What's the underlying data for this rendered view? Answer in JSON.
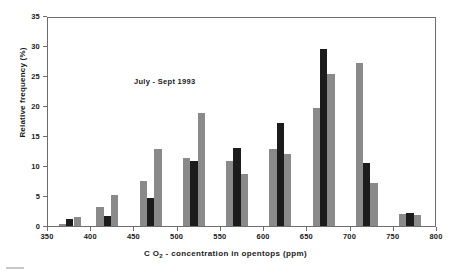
{
  "annotation": {
    "text": "July - Sept 1993"
  },
  "axes": {
    "y_title": "Relative frequency (%)",
    "x_title_pre": "C O",
    "x_title_sub": "2",
    "x_title_post": " - concentration in opentops (ppm)",
    "y_ticks": [
      "0",
      "5",
      "10",
      "15",
      "20",
      "25",
      "30",
      "35"
    ],
    "x_ticks": [
      "350",
      "400",
      "450",
      "500",
      "550",
      "600",
      "650",
      "700",
      "750",
      "800"
    ]
  },
  "chart_data": {
    "type": "bar",
    "title": "",
    "annotations": [
      "July - Sept 1993"
    ],
    "xlabel": "CO2 - concentration in opentops (ppm)",
    "ylabel": "Relative frequency (%)",
    "xlim": [
      350,
      800
    ],
    "ylim": [
      0,
      35
    ],
    "yticks": [
      0,
      5,
      10,
      15,
      20,
      25,
      30,
      35
    ],
    "xticks": [
      350,
      400,
      450,
      500,
      550,
      600,
      650,
      700,
      750,
      800
    ],
    "grid": false,
    "legend": "none",
    "colors": {
      "light": "#8a8a8a",
      "dark": "#1c1c1c"
    },
    "bin_width_ppm": 12.5,
    "bars": [
      {
        "x_left": 362.5,
        "x_right": 371.0,
        "value": 0.3,
        "color": "light"
      },
      {
        "x_left": 371.0,
        "x_right": 379.5,
        "value": 1.2,
        "color": "dark"
      },
      {
        "x_left": 379.5,
        "x_right": 388.0,
        "value": 1.5,
        "color": "light"
      },
      {
        "x_left": 406.0,
        "x_right": 414.5,
        "value": 3.2,
        "color": "light"
      },
      {
        "x_left": 414.5,
        "x_right": 423.0,
        "value": 1.6,
        "color": "dark"
      },
      {
        "x_left": 423.0,
        "x_right": 431.5,
        "value": 5.1,
        "color": "light"
      },
      {
        "x_left": 456.0,
        "x_right": 464.5,
        "value": 7.5,
        "color": "light"
      },
      {
        "x_left": 464.5,
        "x_right": 473.0,
        "value": 4.6,
        "color": "dark"
      },
      {
        "x_left": 473.0,
        "x_right": 481.5,
        "value": 12.9,
        "color": "light"
      },
      {
        "x_left": 506.0,
        "x_right": 514.5,
        "value": 11.4,
        "color": "light"
      },
      {
        "x_left": 514.5,
        "x_right": 523.0,
        "value": 10.9,
        "color": "dark"
      },
      {
        "x_left": 523.0,
        "x_right": 531.5,
        "value": 18.8,
        "color": "light"
      },
      {
        "x_left": 556.0,
        "x_right": 564.5,
        "value": 10.9,
        "color": "light"
      },
      {
        "x_left": 564.5,
        "x_right": 573.0,
        "value": 13.0,
        "color": "dark"
      },
      {
        "x_left": 573.0,
        "x_right": 581.5,
        "value": 8.7,
        "color": "light"
      },
      {
        "x_left": 606.0,
        "x_right": 614.5,
        "value": 12.8,
        "color": "light"
      },
      {
        "x_left": 614.5,
        "x_right": 623.0,
        "value": 17.1,
        "color": "dark"
      },
      {
        "x_left": 623.0,
        "x_right": 631.5,
        "value": 12.0,
        "color": "light"
      },
      {
        "x_left": 656.0,
        "x_right": 664.5,
        "value": 19.7,
        "color": "light"
      },
      {
        "x_left": 664.5,
        "x_right": 673.0,
        "value": 29.5,
        "color": "dark"
      },
      {
        "x_left": 673.0,
        "x_right": 681.5,
        "value": 25.3,
        "color": "light"
      },
      {
        "x_left": 706.0,
        "x_right": 714.5,
        "value": 27.2,
        "color": "light"
      },
      {
        "x_left": 714.5,
        "x_right": 723.0,
        "value": 10.5,
        "color": "dark"
      },
      {
        "x_left": 723.0,
        "x_right": 731.5,
        "value": 7.1,
        "color": "light"
      },
      {
        "x_left": 756.0,
        "x_right": 764.5,
        "value": 2.0,
        "color": "light"
      },
      {
        "x_left": 764.5,
        "x_right": 773.0,
        "value": 2.1,
        "color": "dark"
      },
      {
        "x_left": 773.0,
        "x_right": 781.5,
        "value": 1.8,
        "color": "light"
      }
    ]
  }
}
